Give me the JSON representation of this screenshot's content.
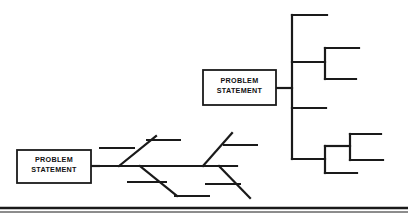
{
  "figure": {
    "type": "diagram",
    "subtype": "cause-and-effect / tree diagram pair",
    "background_color": "#ffffff",
    "line_color": "#1a1a1a",
    "width": 408,
    "height": 220
  },
  "boxes": {
    "fishbone_box": {
      "line1": "PROBLEM",
      "line2": "STATEMENT",
      "x": 17,
      "y": 150,
      "w": 74,
      "h": 33
    },
    "tree_box": {
      "line1": "PROBLEM",
      "line2": "STATEMENT",
      "x": 203,
      "y": 70,
      "w": 73,
      "h": 35
    }
  },
  "fishbone": {
    "name": "cause-and-effect-fishbone",
    "spine": {
      "x1": 91,
      "y1": 166,
      "x2": 237,
      "y2": 166
    },
    "ribs": [
      {
        "name": "rib-upper-left",
        "x1": 119,
        "y1": 166,
        "x2": 156,
        "y2": 136
      },
      {
        "name": "rib-lower-left",
        "x1": 140,
        "y1": 166,
        "x2": 177,
        "y2": 196
      },
      {
        "name": "rib-upper-right",
        "x1": 203,
        "y1": 166,
        "x2": 232,
        "y2": 133
      },
      {
        "name": "rib-lower-right",
        "x1": 219,
        "y1": 166,
        "x2": 250,
        "y2": 198
      }
    ],
    "sub_bones": [
      {
        "name": "subbone-1",
        "x1": 100,
        "y1": 148,
        "x2": 134,
        "y2": 148
      },
      {
        "name": "subbone-2",
        "x1": 147,
        "y1": 140,
        "x2": 180,
        "y2": 140
      },
      {
        "name": "subbone-3",
        "x1": 128,
        "y1": 182,
        "x2": 166,
        "y2": 182
      },
      {
        "name": "subbone-4",
        "x1": 175,
        "y1": 196,
        "x2": 209,
        "y2": 196
      },
      {
        "name": "subbone-5",
        "x1": 224,
        "y1": 145,
        "x2": 257,
        "y2": 145
      },
      {
        "name": "subbone-6",
        "x1": 206,
        "y1": 184,
        "x2": 240,
        "y2": 184
      }
    ],
    "connector": {
      "x1": 91,
      "y1": 166,
      "x2": 99,
      "y2": 166
    }
  },
  "tree": {
    "name": "hierarchical-tree",
    "connector": {
      "x1": 276,
      "y1": 88,
      "x2": 292,
      "y2": 88
    },
    "spine": {
      "x": 292,
      "y1": 15,
      "y2": 159
    },
    "branches": [
      {
        "name": "branch-1",
        "x1": 292,
        "y1": 15,
        "x2": 327,
        "y2": 15
      },
      {
        "name": "branch-2",
        "x1": 292,
        "y1": 62,
        "x2": 325,
        "y2": 62
      },
      {
        "name": "branch-3",
        "x1": 292,
        "y1": 108,
        "x2": 326,
        "y2": 108
      },
      {
        "name": "branch-4",
        "x1": 292,
        "y1": 159,
        "x2": 325,
        "y2": 159
      }
    ],
    "sub_nodes": [
      {
        "name": "subtree-upper",
        "spine": {
          "x": 325,
          "y1": 48,
          "y2": 79
        },
        "leaves": [
          {
            "x1": 325,
            "y1": 48,
            "x2": 359,
            "y2": 48
          },
          {
            "x1": 325,
            "y1": 79,
            "x2": 356,
            "y2": 79
          }
        ]
      },
      {
        "name": "subtree-lower",
        "spine": {
          "x": 325,
          "y1": 146,
          "y2": 173
        },
        "leaves": [
          {
            "x1": 325,
            "y1": 146,
            "x2": 350,
            "y2": 146
          },
          {
            "x1": 325,
            "y1": 173,
            "x2": 357,
            "y2": 173
          }
        ]
      },
      {
        "name": "subtree-lower-right",
        "spine": {
          "x": 350,
          "y1": 134,
          "y2": 160
        },
        "leaves": [
          {
            "x1": 350,
            "y1": 134,
            "x2": 381,
            "y2": 134
          },
          {
            "x1": 350,
            "y1": 160,
            "x2": 383,
            "y2": 160
          }
        ]
      }
    ]
  },
  "footer": {
    "divider_thick": {
      "x1": 0,
      "y1": 208,
      "x2": 408,
      "y2": 208
    },
    "divider_thin": {
      "x1": 0,
      "y1": 212,
      "x2": 408,
      "y2": 212
    }
  }
}
